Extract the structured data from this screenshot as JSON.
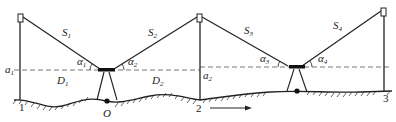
{
  "diagram": {
    "type": "trigonometric-leveling",
    "colors": {
      "line": "#222222",
      "dashed": "#666666",
      "background": "#ffffff"
    },
    "labels": {
      "S1": {
        "main": "S",
        "sub": "1"
      },
      "S2": {
        "main": "S",
        "sub": "2"
      },
      "S3": {
        "main": "S",
        "sub": "3"
      },
      "S4": {
        "main": "S",
        "sub": "4"
      },
      "alpha1": {
        "main": "α",
        "sub": "1"
      },
      "alpha2": {
        "main": "α",
        "sub": "2"
      },
      "alpha3": {
        "main": "α",
        "sub": "3"
      },
      "alpha4": {
        "main": "α",
        "sub": "4"
      },
      "a1": {
        "main": "a",
        "sub": "1"
      },
      "a2": {
        "main": "a",
        "sub": "2"
      },
      "D1": {
        "main": "D",
        "sub": "1"
      },
      "D2": {
        "main": "D",
        "sub": "2"
      },
      "O": "O",
      "point1": "1",
      "point2": "2",
      "point3": "3"
    },
    "direction_arrow": "→"
  }
}
